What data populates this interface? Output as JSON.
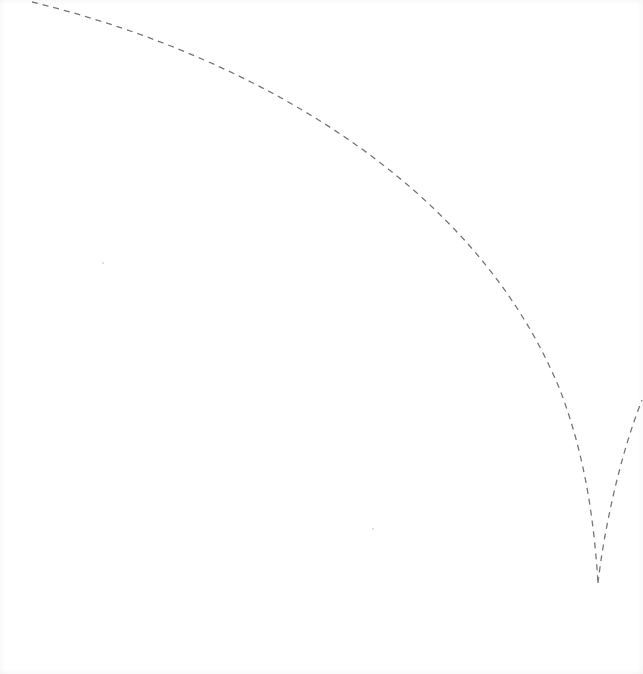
{
  "canvas": {
    "background": "#ffffff",
    "border_tint": "#f4f4f4"
  },
  "path": {
    "stroke": "#777777",
    "stroke_width": 1.3,
    "dash": "6 5",
    "segments": [
      {
        "name": "main-arc",
        "d": "M 32 2 C 230 50, 470 170, 560 390 C 585 455, 594 520, 598 583"
      },
      {
        "name": "rising-arc",
        "d": "M 598 583 C 604 530, 620 455, 642 400"
      }
    ],
    "cusp_point": [
      598,
      583
    ]
  },
  "specks": [
    {
      "x": 102,
      "y": 262
    },
    {
      "x": 372,
      "y": 528
    }
  ]
}
